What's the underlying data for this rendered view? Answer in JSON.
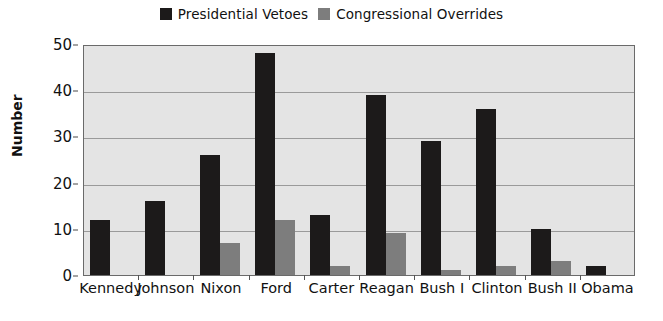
{
  "chart_data": {
    "type": "bar",
    "title": "",
    "xlabel": "",
    "ylabel": "Number",
    "ylim": [
      0,
      50
    ],
    "yticks": [
      0,
      10,
      20,
      30,
      40,
      50
    ],
    "grid": true,
    "legend_position": "top-center",
    "categories": [
      "Kennedy",
      "Johnson",
      "Nixon",
      "Ford",
      "Carter",
      "Reagan",
      "Bush I",
      "Clinton",
      "Bush II",
      "Obama"
    ],
    "series": [
      {
        "name": "Presidential Vetoes",
        "color": "#1c1a1a",
        "values": [
          12,
          16,
          26,
          48,
          13,
          39,
          29,
          36,
          10,
          2
        ]
      },
      {
        "name": "Congressional Overrides",
        "color": "#7d7d7d",
        "values": [
          0,
          0,
          7,
          12,
          2,
          9,
          1,
          2,
          3,
          0
        ]
      }
    ]
  },
  "plot_style": {
    "plot_background": "#e4e4e4",
    "gridline_color": "#9a9a9a",
    "border_color": "#6a6a6a"
  }
}
